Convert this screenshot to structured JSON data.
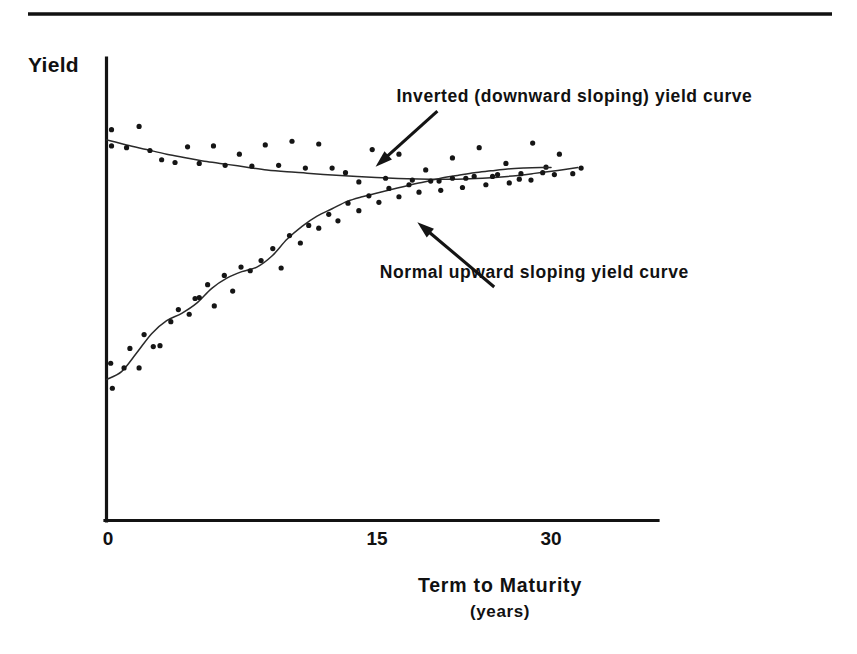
{
  "figure": {
    "name": "yield-curve-figure",
    "background_color": "#ffffff",
    "ink_color": "#111111",
    "top_rule_visible": true
  },
  "chart_data": {
    "type": "scatter",
    "title": "",
    "subtitle": "",
    "xlabel": "Term to Maturity",
    "xlabel_sub": "(years)",
    "ylabel": "Yield",
    "xlim": [
      0,
      33
    ],
    "ylim": [
      0,
      10
    ],
    "xticks": [
      0,
      15,
      30
    ],
    "xtick_labels": [
      "0",
      "15",
      "30"
    ],
    "yticks": [],
    "ytick_labels": [],
    "grid": false,
    "legend_position": "none",
    "axis_style": "open-left-bottom",
    "annotations": [
      {
        "id": "inverted-annotation",
        "text": "Inverted (downward sloping) yield curve",
        "text_x": 28.0,
        "text_y": 9.05,
        "arrow_tail_x": 19.8,
        "arrow_tail_y": 8.85,
        "arrow_tip_x": 16.1,
        "arrow_tip_y": 7.65,
        "arrow_direction": "down-left"
      },
      {
        "id": "normal-annotation",
        "text": "Normal upward sloping yield curve",
        "text_x": 25.6,
        "text_y": 5.25,
        "arrow_tail_x": 23.2,
        "arrow_tail_y": 5.05,
        "arrow_tip_x": 18.6,
        "arrow_tip_y": 6.45,
        "arrow_direction": "up-left"
      }
    ],
    "series": [
      {
        "name": "Inverted (downward sloping) yield curve",
        "kind": "fitted-curve-with-scatter",
        "color": "#2a2a2a",
        "curve": [
          [
            0.0,
            8.23
          ],
          [
            1.2,
            8.12
          ],
          [
            2.4,
            8.02
          ],
          [
            3.6,
            7.92
          ],
          [
            4.8,
            7.84
          ],
          [
            6.0,
            7.76
          ],
          [
            7.2,
            7.7
          ],
          [
            8.4,
            7.64
          ],
          [
            9.6,
            7.58
          ],
          [
            10.8,
            7.54
          ],
          [
            12.0,
            7.51
          ],
          [
            13.5,
            7.47
          ],
          [
            15.0,
            7.44
          ],
          [
            16.5,
            7.41
          ],
          [
            18.0,
            7.39
          ],
          [
            19.5,
            7.38
          ],
          [
            21.0,
            7.38
          ],
          [
            22.5,
            7.4
          ],
          [
            24.0,
            7.44
          ],
          [
            25.5,
            7.5
          ],
          [
            27.0,
            7.57
          ],
          [
            28.2,
            7.63
          ]
        ],
        "scatter": [
          [
            0.3,
            8.45
          ],
          [
            0.3,
            8.1
          ],
          [
            1.2,
            8.06
          ],
          [
            1.95,
            8.52
          ],
          [
            2.6,
            8.0
          ],
          [
            3.3,
            7.8
          ],
          [
            4.1,
            7.74
          ],
          [
            4.85,
            8.08
          ],
          [
            5.55,
            7.72
          ],
          [
            6.4,
            8.1
          ],
          [
            7.1,
            7.68
          ],
          [
            7.95,
            7.92
          ],
          [
            8.7,
            7.66
          ],
          [
            9.5,
            8.12
          ],
          [
            10.3,
            7.68
          ],
          [
            11.1,
            8.2
          ],
          [
            11.9,
            7.62
          ],
          [
            12.7,
            8.14
          ],
          [
            13.5,
            7.62
          ],
          [
            14.3,
            7.52
          ],
          [
            15.1,
            7.32
          ],
          [
            15.9,
            8.02
          ],
          [
            16.7,
            7.4
          ],
          [
            17.5,
            7.92
          ],
          [
            18.3,
            7.36
          ],
          [
            19.1,
            7.58
          ],
          [
            19.9,
            7.34
          ],
          [
            20.7,
            7.84
          ],
          [
            21.5,
            7.4
          ],
          [
            22.3,
            8.06
          ],
          [
            23.1,
            7.44
          ],
          [
            23.9,
            7.72
          ],
          [
            24.7,
            7.38
          ],
          [
            25.5,
            8.16
          ],
          [
            26.3,
            7.64
          ],
          [
            27.1,
            7.92
          ],
          [
            27.9,
            7.5
          ],
          [
            28.4,
            7.62
          ]
        ]
      },
      {
        "name": "Normal upward sloping yield curve",
        "kind": "fitted-curve-with-scatter",
        "color": "#2a2a2a",
        "curve": [
          [
            0.0,
            3.05
          ],
          [
            0.9,
            3.22
          ],
          [
            1.8,
            3.62
          ],
          [
            2.7,
            4.04
          ],
          [
            3.6,
            4.32
          ],
          [
            4.5,
            4.48
          ],
          [
            5.4,
            4.7
          ],
          [
            6.3,
            5.02
          ],
          [
            7.2,
            5.24
          ],
          [
            8.1,
            5.38
          ],
          [
            9.0,
            5.48
          ],
          [
            9.9,
            5.72
          ],
          [
            10.8,
            6.08
          ],
          [
            11.7,
            6.36
          ],
          [
            12.6,
            6.58
          ],
          [
            13.5,
            6.74
          ],
          [
            14.4,
            6.9
          ],
          [
            15.3,
            7.0
          ],
          [
            16.2,
            7.08
          ],
          [
            17.1,
            7.16
          ],
          [
            18.0,
            7.24
          ],
          [
            19.0,
            7.32
          ],
          [
            20.0,
            7.4
          ],
          [
            21.0,
            7.46
          ],
          [
            22.0,
            7.52
          ],
          [
            23.0,
            7.56
          ],
          [
            24.0,
            7.6
          ],
          [
            25.0,
            7.62
          ],
          [
            26.0,
            7.63
          ],
          [
            26.6,
            7.63
          ]
        ],
        "scatter": [
          [
            0.25,
            3.4
          ],
          [
            0.35,
            2.86
          ],
          [
            1.05,
            3.3
          ],
          [
            1.4,
            3.72
          ],
          [
            1.95,
            3.3
          ],
          [
            2.25,
            4.02
          ],
          [
            2.8,
            3.76
          ],
          [
            3.2,
            3.78
          ],
          [
            3.85,
            4.3
          ],
          [
            4.3,
            4.56
          ],
          [
            4.95,
            4.46
          ],
          [
            5.3,
            4.8
          ],
          [
            5.55,
            4.82
          ],
          [
            6.05,
            5.1
          ],
          [
            6.45,
            4.64
          ],
          [
            7.05,
            5.3
          ],
          [
            7.55,
            4.96
          ],
          [
            8.05,
            5.48
          ],
          [
            8.6,
            5.4
          ],
          [
            9.25,
            5.62
          ],
          [
            9.95,
            5.88
          ],
          [
            10.45,
            5.46
          ],
          [
            10.95,
            6.16
          ],
          [
            11.6,
            6.0
          ],
          [
            12.1,
            6.38
          ],
          [
            12.7,
            6.32
          ],
          [
            13.3,
            6.62
          ],
          [
            13.85,
            6.48
          ],
          [
            14.45,
            6.86
          ],
          [
            15.1,
            6.7
          ],
          [
            15.7,
            7.02
          ],
          [
            16.3,
            6.88
          ],
          [
            16.9,
            7.18
          ],
          [
            17.5,
            7.0
          ],
          [
            18.1,
            7.26
          ],
          [
            18.7,
            7.1
          ],
          [
            19.4,
            7.34
          ],
          [
            20.0,
            7.14
          ],
          [
            20.7,
            7.4
          ],
          [
            21.3,
            7.2
          ],
          [
            22.0,
            7.44
          ],
          [
            22.7,
            7.26
          ],
          [
            23.4,
            7.48
          ],
          [
            24.1,
            7.3
          ],
          [
            24.8,
            7.5
          ],
          [
            25.4,
            7.36
          ],
          [
            26.1,
            7.52
          ],
          [
            26.8,
            7.48
          ]
        ]
      }
    ]
  }
}
